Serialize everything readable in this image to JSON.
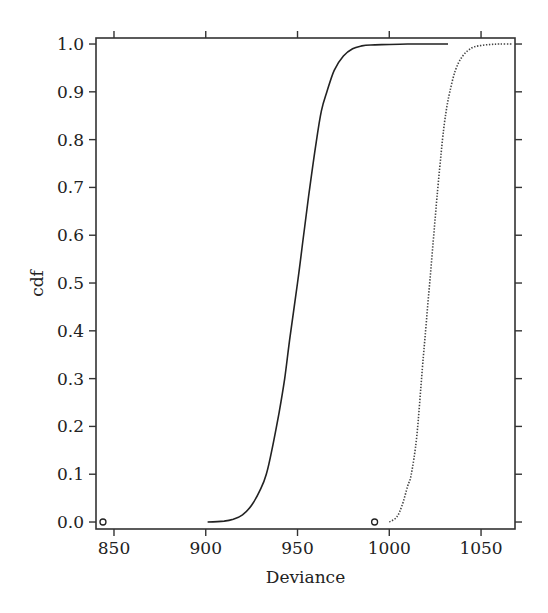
{
  "chart_data": {
    "type": "line",
    "title": "",
    "xlabel": "Deviance",
    "ylabel": "cdf",
    "xlim": [
      840.2,
      1068.5
    ],
    "ylim": [
      -0.0146,
      1.0126
    ],
    "x_ticks": [
      850,
      900,
      950,
      1000,
      1050
    ],
    "x_tick_labels": [
      "850",
      "900",
      "950",
      "1000",
      "1050"
    ],
    "y_ticks": [
      0.0,
      0.1,
      0.2,
      0.3,
      0.4,
      0.5,
      0.6,
      0.7,
      0.8,
      0.9,
      1.0
    ],
    "y_tick_labels": [
      "0.0",
      "0.1",
      "0.2",
      "0.3",
      "0.4",
      "0.5",
      "0.6",
      "0.7",
      "0.8",
      "0.9",
      "1.0"
    ],
    "grid": false,
    "legend": null,
    "series": [
      {
        "name": "solid",
        "style": "solid",
        "x": [
          901,
          910,
          915,
          920,
          925,
          930,
          933,
          936,
          940,
          943,
          946,
          950,
          953,
          956,
          960,
          963,
          966,
          970,
          975,
          980,
          985,
          990,
          1000,
          1010,
          1020,
          1032
        ],
        "y": [
          0.0,
          0.002,
          0.006,
          0.015,
          0.035,
          0.07,
          0.1,
          0.15,
          0.23,
          0.3,
          0.39,
          0.5,
          0.59,
          0.68,
          0.79,
          0.86,
          0.9,
          0.945,
          0.975,
          0.99,
          0.996,
          0.998,
          0.999,
          1.0,
          1.0,
          1.0
        ]
      },
      {
        "name": "dotted",
        "style": "dotted",
        "x": [
          1000,
          1004,
          1007,
          1010,
          1012,
          1015,
          1018,
          1020,
          1022,
          1024,
          1026,
          1029,
          1031,
          1033,
          1036,
          1040,
          1045,
          1050,
          1055,
          1060,
          1067
        ],
        "y": [
          0.0,
          0.01,
          0.035,
          0.075,
          0.1,
          0.18,
          0.32,
          0.41,
          0.5,
          0.59,
          0.68,
          0.8,
          0.86,
          0.9,
          0.945,
          0.975,
          0.992,
          0.997,
          0.999,
          1.0,
          1.0
        ]
      }
    ],
    "points": [
      {
        "x": 844,
        "y": 0.0,
        "marker": "open-circle"
      },
      {
        "x": 992,
        "y": 0.0,
        "marker": "open-circle"
      }
    ]
  }
}
